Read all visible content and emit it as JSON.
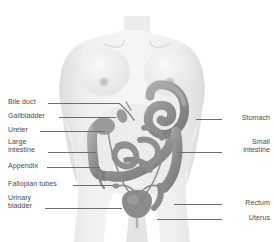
{
  "figure": {
    "title_fragment": "",
    "background_color": "#ffffff",
    "body_color": "#ededed",
    "body_shadow_color": "#d6d6d6",
    "organ_color": "#949494",
    "organ_dark_color": "#7d7d7d",
    "organ_light_color": "#b4b4b4",
    "text_color": "#4a4a4a",
    "leader_color": "#6d6d6d"
  },
  "labels_left": [
    {
      "id": "bile-duct",
      "text": "Bile duct",
      "y": 98,
      "line_y": 103,
      "line_x": 48,
      "line_w": 72
    },
    {
      "id": "gallbladder",
      "text": "Gallbladder",
      "y": 112,
      "line_y": 117,
      "line_x": 59,
      "line_w": 57
    },
    {
      "id": "ureter",
      "text": "Ureter",
      "y": 126,
      "line_y": 131,
      "line_x": 40,
      "line_w": 65
    },
    {
      "id": "large-intestine",
      "text": "Large\nintestine",
      "y": 138,
      "line_y": 152,
      "line_x": 48,
      "line_w": 48
    },
    {
      "id": "appendix",
      "text": "Appendix",
      "y": 162,
      "line_y": 167,
      "line_x": 47,
      "line_w": 53
    },
    {
      "id": "fallopian-tubes",
      "text": "Fallopian tubes",
      "y": 180,
      "line_y": 185,
      "line_x": 73,
      "line_w": 40
    },
    {
      "id": "urinary-bladder",
      "text": "Urinary\nbladder",
      "y": 194,
      "line_y": 208,
      "line_x": 45,
      "line_w": 77
    }
  ],
  "labels_right": [
    {
      "id": "stomach",
      "text": "Stomach",
      "y": 114,
      "line_y": 119,
      "line_x": 196,
      "line_w": 26
    },
    {
      "id": "small-intestine",
      "text": "Small\nintestine",
      "y": 138,
      "line_y": 152,
      "line_x": 178,
      "line_w": 44
    },
    {
      "id": "rectum",
      "text": "Rectum",
      "y": 199,
      "line_y": 204,
      "line_x": 174,
      "line_w": 48
    },
    {
      "id": "uterus",
      "text": "Uterus",
      "y": 214,
      "line_y": 219,
      "line_x": 157,
      "line_w": 65
    }
  ]
}
